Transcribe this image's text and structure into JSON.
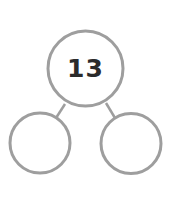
{
  "diagram": {
    "type": "number-bond",
    "whole": {
      "value": "13"
    },
    "parts": [
      {
        "value": ""
      },
      {
        "value": ""
      }
    ],
    "colors": {
      "stroke": "#9e9e9e",
      "text": "#2b2b2b",
      "background": "#ffffff"
    }
  }
}
